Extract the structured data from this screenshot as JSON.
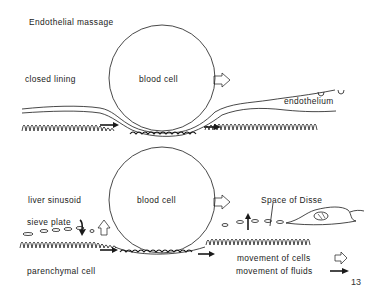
{
  "figure": {
    "title": "Endothelial massage",
    "page_number": "13",
    "colors": {
      "ink": "#1a1a1a",
      "background": "#ffffff"
    }
  },
  "top_panel": {
    "labels": {
      "closed_lining": "closed lining",
      "blood_cell": "blood cell",
      "endothelium": "endothelium"
    }
  },
  "bottom_panel": {
    "labels": {
      "liver_sinusoid": "liver sinusoid",
      "blood_cell": "blood cell",
      "sieve_plate": "sieve plate",
      "space_of_disse": "Space of Disse",
      "parenchymal_cell": "parenchymal cell"
    }
  },
  "legend": {
    "items": [
      {
        "label": "movement of cells",
        "icon": "hollow-arrow-icon"
      },
      {
        "label": "movement of fluids",
        "icon": "solid-arrow-icon"
      }
    ]
  }
}
